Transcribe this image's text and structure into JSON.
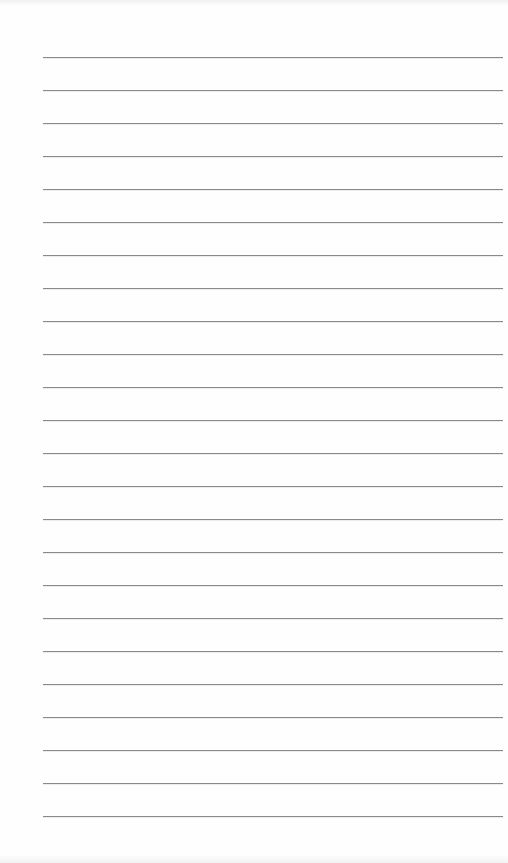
{
  "page": {
    "type": "lined-paper",
    "rule_count": 24,
    "rule_color": "#8a8a8a",
    "background_color": "#ffffff",
    "text": ""
  }
}
